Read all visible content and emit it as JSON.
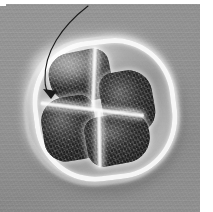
{
  "figure": {
    "kind": "micrograph",
    "modality": "electron-micrograph",
    "caption": "",
    "background_color": "#8d8d8d",
    "wall_color": "#fcfcfc",
    "lobe_color": "#3b3b3b",
    "arrow_color": "#1a1a1a",
    "margin_color": "#ffffff"
  },
  "specimen": {
    "label": "specimen",
    "outline_label": "cell wall",
    "septum_label": "dividing septum",
    "lobes": [
      {
        "id": "top",
        "label": "upper lobe"
      },
      {
        "id": "right",
        "label": "right lobe"
      },
      {
        "id": "left",
        "label": "left lobe"
      },
      {
        "id": "bottom",
        "label": "lower lobe"
      }
    ]
  },
  "annotation": {
    "arrow": {
      "label": "pointer arrow",
      "path": "M 88 2 C 62 22, 44 48, 45 76 C 45 84, 47 88, 50 92",
      "tip_x": 51,
      "tip_y": 94,
      "stroke_width": 1.1,
      "color": "#1a1a1a",
      "head_points": "51,95 43,85 57,87",
      "points_to": "left lobe"
    },
    "text": ""
  }
}
